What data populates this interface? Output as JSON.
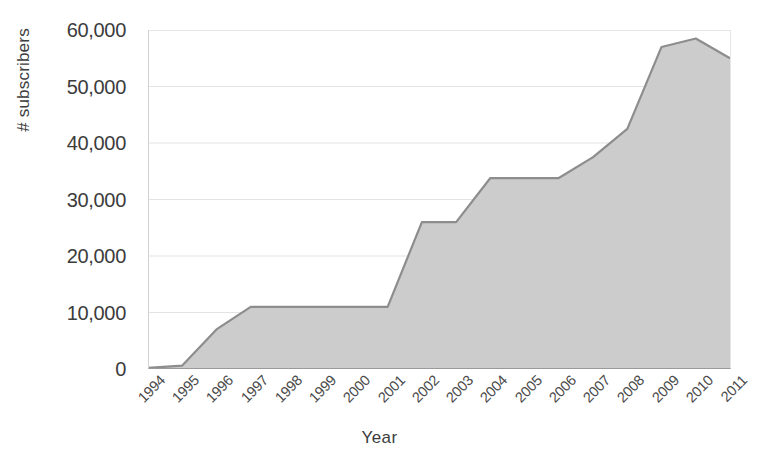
{
  "chart_data": {
    "type": "area",
    "title": "",
    "xlabel": "Year",
    "ylabel": "# subscribers",
    "categories": [
      "1994",
      "1995",
      "1996",
      "1997",
      "1998",
      "1999",
      "2000",
      "2001",
      "2002",
      "2003",
      "2004",
      "2005",
      "2006",
      "2007",
      "2008",
      "2009",
      "2010",
      "2011"
    ],
    "values": [
      200,
      600,
      7000,
      11000,
      11000,
      11000,
      11000,
      11000,
      26000,
      26000,
      33800,
      33800,
      33800,
      37500,
      42500,
      57000,
      58500,
      55000
    ],
    "series": [
      {
        "name": "# subscribers",
        "values": [
          200,
          600,
          7000,
          11000,
          11000,
          11000,
          11000,
          11000,
          26000,
          26000,
          33800,
          33800,
          33800,
          37500,
          42500,
          57000,
          58500,
          55000
        ]
      }
    ],
    "ylim": [
      0,
      60000
    ],
    "xlim": [
      "1994",
      "2011"
    ],
    "ytick_values": [
      0,
      10000,
      20000,
      30000,
      40000,
      50000,
      60000
    ],
    "ytick_labels": [
      "0",
      "10,000",
      "20,000",
      "30,000",
      "40,000",
      "50,000",
      "60,000"
    ],
    "grid": true,
    "grid_axis": "y",
    "legend": false,
    "legend_position": "none",
    "fill_color": "#c9c9c9",
    "line_color": "#8d8d8d",
    "background_color": "#ffffff",
    "axis_color": "#9a9a9a",
    "gridline_color": "#e3e3e3",
    "xtick_rotation": -45
  }
}
